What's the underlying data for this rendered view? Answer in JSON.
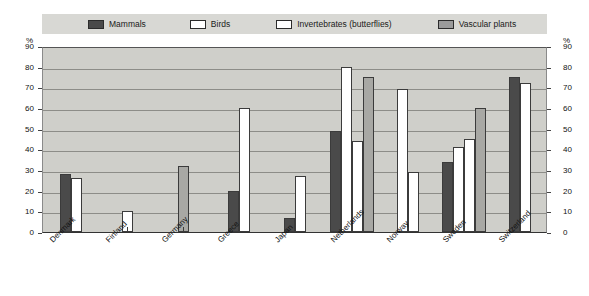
{
  "legend": {
    "items": [
      {
        "label": "Mammals",
        "key": "mammals",
        "color": "#4a4a4a"
      },
      {
        "label": "Birds",
        "key": "birds",
        "color": "#ffffff"
      },
      {
        "label": "Invertebrates (butterflies)",
        "key": "invertebrates",
        "color": "#ffffff"
      },
      {
        "label": "Vascular plants",
        "key": "vascular",
        "color": "#a8a8a4"
      }
    ]
  },
  "axis": {
    "unit_left": "%",
    "unit_right": "%",
    "ticks": [
      "90",
      "80",
      "70",
      "60",
      "50",
      "40",
      "30",
      "20",
      "10",
      "0"
    ]
  },
  "chart_data": {
    "type": "bar",
    "title": "",
    "xlabel": "",
    "ylabel": "%",
    "ylim": [
      0,
      90
    ],
    "yticks": [
      0,
      10,
      20,
      30,
      40,
      50,
      60,
      70,
      80,
      90
    ],
    "grid": true,
    "legend_position": "top",
    "categories": [
      "Denmark",
      "Finland",
      "Germany",
      "Greece",
      "Japan",
      "Netherlands",
      "Norway",
      "Sweden",
      "Switzerland"
    ],
    "series": [
      {
        "name": "Mammals",
        "values": [
          28,
          null,
          null,
          20,
          7,
          49,
          null,
          34,
          75
        ]
      },
      {
        "name": "Birds",
        "values": [
          26,
          10,
          null,
          60,
          27,
          80,
          69,
          41,
          72
        ]
      },
      {
        "name": "Invertebrates (butterflies)",
        "values": [
          null,
          null,
          null,
          null,
          null,
          44,
          29,
          45,
          null
        ]
      },
      {
        "name": "Vascular plants",
        "values": [
          null,
          null,
          32,
          null,
          null,
          75,
          null,
          60,
          null
        ]
      }
    ]
  }
}
